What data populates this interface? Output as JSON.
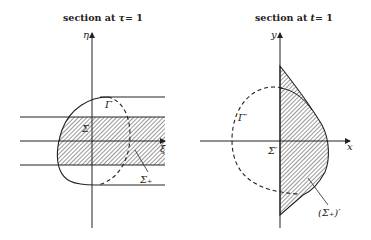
{
  "left_panel": {
    "title_prefix": "section at",
    "title_var": "τ",
    "title_suffix": "= 1",
    "axis_vertical": "η",
    "axis_horizontal": "ξ",
    "curve_label": "Γ",
    "origin_label": "Σ̇",
    "region_label": "Σ₊"
  },
  "right_panel": {
    "title_prefix": "section at",
    "title_var": "t",
    "title_suffix": "= 1",
    "axis_vertical": "y",
    "axis_horizontal": "x",
    "curve_label": "Γ′",
    "origin_label": "Σ̇′",
    "region_label": "(Σ₊)′"
  },
  "colors": {
    "ink": "#222222",
    "background": "#ffffff"
  }
}
